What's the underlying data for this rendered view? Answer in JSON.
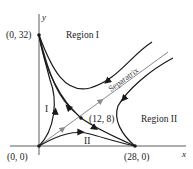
{
  "diagram": {
    "type": "phase-plane",
    "axes": {
      "x_label": "x",
      "y_label": "y"
    },
    "points": [
      {
        "label": "(0, 32)",
        "x": 0,
        "y": 32
      },
      {
        "label": "(0, 0)",
        "x": 0,
        "y": 0
      },
      {
        "label": "(28, 0)",
        "x": 28,
        "y": 0
      },
      {
        "label": "(12, 8)",
        "x": 12,
        "y": 8
      }
    ],
    "regions": {
      "region_1": "Region I",
      "region_2": "Region II",
      "small_1": "I",
      "small_2": "II"
    },
    "separatrix_label": "Separatrix",
    "colors": {
      "curve": "#1a1a1a",
      "separatrix": "#8a8a8a",
      "axis": "#333333"
    }
  }
}
